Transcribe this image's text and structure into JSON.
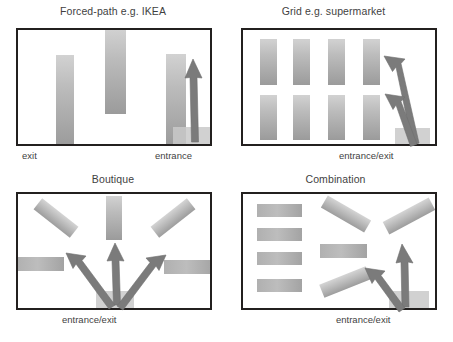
{
  "figure": {
    "width": 453,
    "height": 342,
    "background": "#ffffff",
    "frame_color": "#23201f",
    "shelf_color": "#b4b4b4",
    "arrow_color": "#7b7b7b",
    "pad_color": "#c9c9c9"
  },
  "panels": [
    {
      "id": "forced-path",
      "title": "Forced-path e.g. IKEA",
      "captions": [
        {
          "text": "exit",
          "position": "bottom-left"
        },
        {
          "text": "entrance",
          "position": "bottom-right"
        }
      ],
      "fixture_count": 3,
      "arrow_count": 1,
      "layout": "three vertical shelves forming a single forced route"
    },
    {
      "id": "grid",
      "title": "Grid e.g. supermarket",
      "captions": [
        {
          "text": "entrance/exit",
          "position": "bottom-right"
        }
      ],
      "fixture_count": 8,
      "arrow_count": 2,
      "layout": "4 columns by 2 rows of vertical gondola shelves"
    },
    {
      "id": "boutique",
      "title": "Boutique",
      "captions": [
        {
          "text": "entrance/exit",
          "position": "bottom-center"
        }
      ],
      "fixture_count": 5,
      "arrow_count": 3,
      "layout": "free-form angled fixtures with fanned circulation"
    },
    {
      "id": "combination",
      "title": "Combination",
      "captions": [
        {
          "text": "entrance/exit",
          "position": "bottom-right"
        }
      ],
      "fixture_count": 8,
      "arrow_count": 2,
      "layout": "grid block on the left plus angled boutique fixtures on the right"
    }
  ]
}
